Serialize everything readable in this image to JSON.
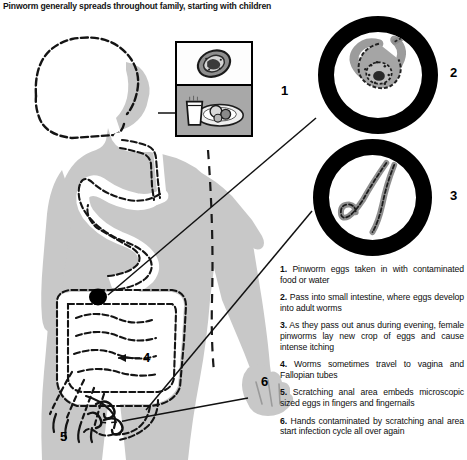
{
  "title": "Pinworm generally spreads throughout family, starting with children",
  "figure": {
    "silhouette_color": "#c8c8c8",
    "outline_color": "#111111",
    "organs": [
      "esophagus",
      "stomach",
      "small-intestine",
      "large-intestine",
      "colon",
      "anus"
    ],
    "egg_mass_marker": "black-dot-in-colon"
  },
  "callouts": [
    {
      "number": "1",
      "target": "contaminated-food-and-water-inset"
    },
    {
      "number": "2",
      "target": "gravid-female-worm-with-eggs-circle"
    },
    {
      "number": "3",
      "target": "adult-pinworms-circle"
    },
    {
      "number": "4",
      "target": "vagina-and-fallopian-tubes-arrow"
    },
    {
      "number": "5",
      "target": "scratching-hand-anal-area"
    },
    {
      "number": "6",
      "target": "contaminated-hand"
    }
  ],
  "insets": {
    "photo_box": {
      "top_panel": "pinworm-egg-micrograph",
      "bottom_panel": "glass-of-milk-and-plate-of-food"
    },
    "circle_2": "coiled-gravid-pinworm-filled-with-eggs",
    "circle_3": "two-adult-pinworms-with-curled-tails"
  },
  "captions": [
    {
      "number": "1.",
      "text": "Pinworm eggs taken in with contaminated food or water"
    },
    {
      "number": "2.",
      "text": "Pass into small intestine, where eggs develop into adult worms"
    },
    {
      "number": "3.",
      "text": "As they pass out anus during evening, female pinworms lay new crop of eggs and cause intense itching"
    },
    {
      "number": "4.",
      "text": "Worms sometimes travel to vagina and Fallopian tubes"
    },
    {
      "number": "5.",
      "text": "Scratching anal area embeds microscopic sized eggs in fingers and fingernails"
    },
    {
      "number": "6.",
      "text": "Hands contaminated by scratching anal area start infection cycle all over again"
    }
  ]
}
